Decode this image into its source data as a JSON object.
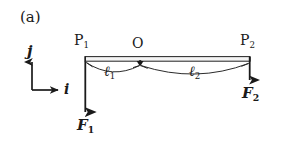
{
  "figure": {
    "panel_tag": "(a)",
    "background_color": "#ffffff",
    "ink_color": "#1a1a1a",
    "caption_kind": "free-body-diagram"
  },
  "basis": {
    "vertical_label": "j",
    "horizontal_label": "i",
    "origin_x": 32,
    "origin_y": 90,
    "vertical_tip_y": 57,
    "horizontal_tip_x": 60
  },
  "beam": {
    "left_x": 85,
    "right_x": 250,
    "top_y": 57,
    "bottom_y": 61,
    "point_labels": {
      "left": "P",
      "left_sub": "1",
      "center": "O",
      "right": "P",
      "right_sub": "2"
    },
    "pivot_x": 140
  },
  "lengths": [
    {
      "symbol": "ℓ",
      "sub": "1",
      "from": "P1",
      "to": "O",
      "label_x": 104
    },
    {
      "symbol": "ℓ",
      "sub": "2",
      "from": "O",
      "to": "P2",
      "label_x": 189
    }
  ],
  "forces": [
    {
      "symbol": "F",
      "sub": "1",
      "direction": "down",
      "at_x": 85,
      "start_y": 61,
      "end_y": 115,
      "label_x": 77,
      "label_y": 118
    },
    {
      "symbol": "F",
      "sub": "2",
      "direction": "down",
      "at_x": 250,
      "start_y": 57,
      "end_y": 83,
      "label_x": 242,
      "label_y": 86
    }
  ]
}
